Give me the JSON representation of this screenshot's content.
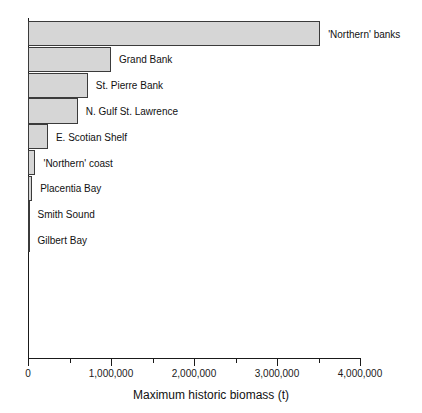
{
  "chart_data": {
    "type": "bar",
    "orientation": "horizontal",
    "title": "",
    "xlabel": "Maximum historic biomass (t)",
    "ylabel": "",
    "xlim": [
      0,
      4000000
    ],
    "grid": false,
    "legend": null,
    "categories": [
      "'Northern' banks",
      "Grand Bank",
      "St. Pierre Bank",
      "N. Gulf St. Lawrence",
      "E. Scotian Shelf",
      "'Northern' coast",
      "Placentia Bay",
      "Smith Sound",
      "Gilbert Bay"
    ],
    "values": [
      3520000,
      1000000,
      720000,
      600000,
      240000,
      90000,
      50000,
      18000,
      2000
    ],
    "bars": [
      {
        "label": "'Northern' banks",
        "value": 3520000
      },
      {
        "label": "Grand Bank",
        "value": 1000000
      },
      {
        "label": "St. Pierre Bank",
        "value": 720000
      },
      {
        "label": "N. Gulf St. Lawrence",
        "value": 600000
      },
      {
        "label": "E. Scotian Shelf",
        "value": 240000
      },
      {
        "label": "'Northern' coast",
        "value": 90000
      },
      {
        "label": "Placentia Bay",
        "value": 50000
      },
      {
        "label": "Smith Sound",
        "value": 18000
      },
      {
        "label": "Gilbert Bay",
        "value": 2000
      }
    ],
    "x_ticks": [
      {
        "value": 0,
        "label": "0",
        "major": true
      },
      {
        "value": 500000,
        "label": "",
        "major": false
      },
      {
        "value": 1000000,
        "label": "1,000,000",
        "major": true
      },
      {
        "value": 1500000,
        "label": "",
        "major": false
      },
      {
        "value": 2000000,
        "label": "2,000,000",
        "major": true
      },
      {
        "value": 2500000,
        "label": "",
        "major": false
      },
      {
        "value": 3000000,
        "label": "3,000,000",
        "major": true
      },
      {
        "value": 3500000,
        "label": "",
        "major": false
      },
      {
        "value": 4000000,
        "label": "4,000,000",
        "major": true
      }
    ],
    "colors": {
      "bar_fill": "#d6d6d6",
      "bar_stroke": "#3b3b3b",
      "axis": "#1a1a1a",
      "text": "#111111",
      "background": "#ffffff"
    }
  }
}
